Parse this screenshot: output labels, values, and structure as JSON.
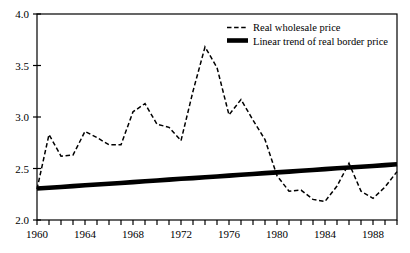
{
  "chart_data": {
    "type": "line",
    "title": "",
    "subtitle": "",
    "xlabel": "",
    "ylabel": "",
    "xlim": [
      1960,
      1990
    ],
    "ylim": [
      2.0,
      4.0
    ],
    "grid": false,
    "legend_position": "top-right",
    "x_tick_labels": [
      "1960",
      "1964",
      "1968",
      "1972",
      "1976",
      "1980",
      "1984",
      "1988"
    ],
    "x_tick_values": [
      1960,
      1964,
      1968,
      1972,
      1976,
      1980,
      1984,
      1988
    ],
    "x_minor_tick_interval": 1,
    "y_tick_labels": [
      "2.0",
      "2.5",
      "3.0",
      "3.5",
      "4.0"
    ],
    "y_tick_values": [
      2.0,
      2.5,
      3.0,
      3.5,
      4.0
    ],
    "x": [
      1960,
      1961,
      1962,
      1963,
      1964,
      1965,
      1966,
      1967,
      1968,
      1969,
      1970,
      1971,
      1972,
      1973,
      1974,
      1975,
      1976,
      1977,
      1978,
      1979,
      1980,
      1981,
      1982,
      1983,
      1984,
      1985,
      1986,
      1987,
      1988,
      1989,
      1990
    ],
    "series": [
      {
        "name": "Real wholesale price",
        "style": "dashed",
        "color": "#000000",
        "values": [
          2.3,
          2.83,
          2.62,
          2.63,
          2.86,
          2.8,
          2.73,
          2.73,
          3.05,
          3.13,
          2.93,
          2.9,
          2.77,
          3.25,
          3.68,
          3.48,
          3.02,
          3.17,
          2.97,
          2.78,
          2.43,
          2.28,
          2.29,
          2.2,
          2.18,
          2.33,
          2.55,
          2.28,
          2.21,
          2.32,
          2.47
        ]
      },
      {
        "name": "Linear trend of real border price",
        "style": "solid-thick",
        "color": "#000000",
        "values": [
          2.305,
          2.313,
          2.321,
          2.329,
          2.337,
          2.344,
          2.352,
          2.36,
          2.368,
          2.376,
          2.384,
          2.392,
          2.4,
          2.407,
          2.415,
          2.423,
          2.431,
          2.439,
          2.447,
          2.455,
          2.462,
          2.47,
          2.478,
          2.486,
          2.494,
          2.502,
          2.51,
          2.517,
          2.525,
          2.533,
          2.541
        ]
      }
    ],
    "legend": [
      {
        "label": "Real wholesale price",
        "style": "dashed"
      },
      {
        "label": "Linear trend of real border price",
        "style": "solid-thick"
      }
    ]
  }
}
